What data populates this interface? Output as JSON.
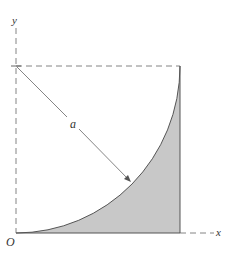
{
  "labels": {
    "y_axis": "y",
    "x_axis": "x",
    "origin": "O",
    "radius": "a"
  },
  "colors": {
    "stroke": "#555555",
    "dash": "#777777",
    "fill": "#c8c8c8",
    "text": "#333333"
  },
  "geometry": {
    "origin": [
      16,
      233
    ],
    "arc_center": [
      16,
      66
    ],
    "square_right_x": 180,
    "radius_px": 165
  }
}
